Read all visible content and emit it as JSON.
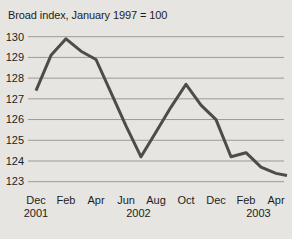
{
  "header": {
    "title": "Broad index, January 1997 = 100"
  },
  "colors": {
    "background": "#e6e5e2",
    "text": "#1d1d1b",
    "gridline": "#9a9a96",
    "line": "#4c4c4a"
  },
  "chart_data": {
    "type": "line",
    "title": "Broad index, January 1997 = 100",
    "categories": [
      "Dec 2001",
      "Jan 2002",
      "Feb 2002",
      "Mar 2002",
      "Apr 2002",
      "May 2002",
      "Jun 2002",
      "Jul 2002",
      "Aug 2002",
      "Sep 2002",
      "Oct 2002",
      "Nov 2002",
      "Dec 2002",
      "Jan 2003",
      "Feb 2003",
      "Mar 2003",
      "Apr 2003"
    ],
    "values": [
      127.4,
      129.1,
      129.9,
      129.3,
      128.9,
      127.3,
      125.7,
      124.2,
      125.4,
      126.6,
      127.7,
      126.7,
      126.0,
      124.2,
      124.4,
      123.7,
      123.4
    ],
    "end_value_at_plot_right_edge": 123.3,
    "ylim": [
      123,
      130
    ],
    "yticks": [
      130,
      129,
      128,
      127,
      126,
      125,
      124,
      123
    ],
    "xtick_labels": [
      "Dec",
      "Feb",
      "Apr",
      "Jun",
      "Aug",
      "Oct",
      "Dec",
      "Feb",
      "Apr"
    ],
    "xtick_month_indices": [
      0,
      2,
      4,
      6,
      8,
      10,
      12,
      14,
      16
    ],
    "year_labels": [
      "2001",
      "2002",
      "2003"
    ],
    "grid": "horizontal-only",
    "legend": "none"
  }
}
